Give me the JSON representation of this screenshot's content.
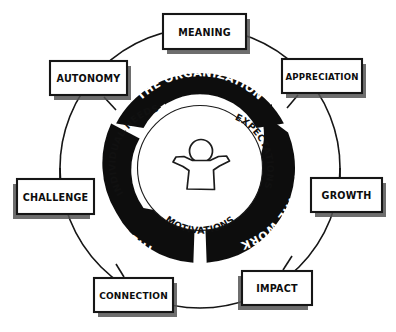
{
  "diagram": {
    "center": {
      "x": 200,
      "y": 168
    },
    "colors": {
      "ink": "#111111",
      "ring_fill": "#111111",
      "ring_text": "#ffffff",
      "paper": "#ffffff",
      "shadow": "#4a4a4a",
      "inner_text": "#111111"
    },
    "geometry": {
      "outer_thin_circle_radius": 140,
      "ring_outer_radius": 95,
      "ring_inner_radius": 64,
      "inner_circle_radius": 62
    },
    "ring_segments": [
      {
        "id": "the-organization",
        "label": "THE ORGANIZATION",
        "position": "top",
        "start_angle": -152,
        "end_angle": -28
      },
      {
        "id": "the-work",
        "label": "THE WORK",
        "position": "lower-right",
        "start_angle": -22,
        "end_angle": 86
      },
      {
        "id": "the-people",
        "label": "THE PEOPLE",
        "position": "lower-left",
        "start_angle": 94,
        "end_angle": 208
      }
    ],
    "inner_labels": [
      {
        "id": "individual-needs",
        "label": "INDIVIDUAL NEEDS",
        "position": "upper-left"
      },
      {
        "id": "expectations",
        "label": "EXPECTATIONS",
        "position": "upper-right"
      },
      {
        "id": "motivations",
        "label": "MOTIVATIONS",
        "position": "bottom"
      }
    ],
    "center_icon": {
      "id": "person-raised-arms-icon",
      "name": "person-icon",
      "description": "stick figure person with both arms raised"
    },
    "cards": [
      {
        "id": "meaning",
        "label": "MEANING",
        "x": 163,
        "y": 14,
        "w": 83,
        "h": 35,
        "angle": -90,
        "text_x": 204,
        "text_y": 33
      },
      {
        "id": "autonomy",
        "label": "AUTONOMY",
        "x": 50,
        "y": 61,
        "w": 77,
        "h": 34,
        "angle": -135,
        "text_x": 89,
        "text_y": 80
      },
      {
        "id": "appreciation",
        "label": "APPRECIATION",
        "x": 282,
        "y": 59,
        "w": 80,
        "h": 34,
        "angle": -45,
        "text_x": 322,
        "text_y": 78
      },
      {
        "id": "challenge",
        "label": "CHALLENGE",
        "x": 17,
        "y": 179,
        "w": 77,
        "h": 35,
        "angle": 180,
        "text_x": 56,
        "text_y": 198
      },
      {
        "id": "growth",
        "label": "GROWTH",
        "x": 311,
        "y": 178,
        "w": 71,
        "h": 34,
        "angle": 0,
        "text_x": 347,
        "text_y": 197
      },
      {
        "id": "connection",
        "label": "CONNECTION",
        "x": 94,
        "y": 278,
        "w": 79,
        "h": 34,
        "angle": 125,
        "text_x": 134,
        "text_y": 297
      },
      {
        "id": "impact",
        "label": "IMPACT",
        "x": 242,
        "y": 271,
        "w": 70,
        "h": 34,
        "angle": 57,
        "text_x": 277,
        "text_y": 290
      }
    ]
  }
}
